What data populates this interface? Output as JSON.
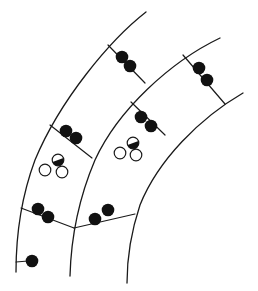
{
  "diagram": {
    "colors": {
      "line": "#1a1a1a",
      "filled": "#111111",
      "background": "#ffffff"
    },
    "strands": [
      {
        "id": "strand-outer",
        "path": "M146,12 C110,40 60,100 35,160 C22,195 16,235 16,272"
      },
      {
        "id": "strand-middle",
        "path": "M220,38 C170,62 118,110 95,160 C78,200 71,240 70,276"
      },
      {
        "id": "strand-inner",
        "path": "M243,93 C200,118 158,160 140,205 C130,235 127,258 127,283"
      }
    ],
    "crosslinks": [
      {
        "id": "link-top",
        "path": "M108,45 L145,83",
        "dots": [
          [
            122,
            57
          ],
          [
            130,
            66
          ]
        ]
      },
      {
        "id": "link-right",
        "path": "M183,55 L225,104",
        "dots": [
          [
            199,
            68
          ],
          [
            207,
            80
          ]
        ]
      },
      {
        "id": "link-mid-left",
        "path": "M50,125 L92,158",
        "dots": [
          [
            66,
            131
          ],
          [
            76,
            138
          ]
        ]
      },
      {
        "id": "link-mid-right",
        "path": "M131,102 L165,135",
        "dots": [
          [
            141,
            117
          ],
          [
            151,
            126
          ]
        ]
      },
      {
        "id": "link-low-left",
        "path": "M21,208 L74,228",
        "dots": [
          [
            38,
            209
          ],
          [
            48,
            217
          ]
        ]
      },
      {
        "id": "link-low-right",
        "path": "M74,228 L135,214",
        "dots": [
          [
            95,
            219
          ],
          [
            108,
            210
          ]
        ]
      },
      {
        "id": "link-bottom",
        "path": "M16,262 L28,261",
        "dots": [
          [
            32,
            261
          ]
        ]
      }
    ],
    "open_clusters": [
      {
        "id": "cluster-left",
        "rings": [
          [
            58,
            160
          ],
          [
            45,
            170
          ],
          [
            62,
            172
          ]
        ],
        "half_filled_index": 0
      },
      {
        "id": "cluster-right",
        "rings": [
          [
            133,
            143
          ],
          [
            120,
            153
          ],
          [
            136,
            155
          ]
        ],
        "half_filled_index": 0
      }
    ]
  }
}
